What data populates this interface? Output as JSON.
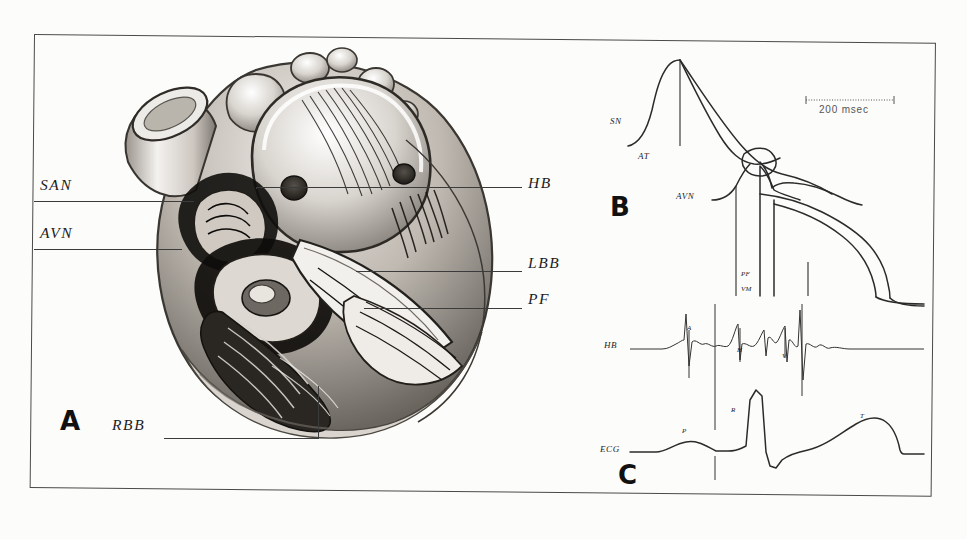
{
  "figure": {
    "caption_absent": true,
    "panels": [
      {
        "id": "A",
        "letter": "A",
        "kind": "anatomical-illustration",
        "subject": "heart cardiac conduction system"
      },
      {
        "id": "B",
        "letter": "B",
        "kind": "action-potential-tracings"
      },
      {
        "id": "C",
        "letter": "C",
        "kind": "electrogram-tracings"
      }
    ]
  },
  "panel_a": {
    "letter": "A",
    "labels_left": [
      {
        "name": "SAN",
        "text": "SAN"
      },
      {
        "name": "AVN",
        "text": "AVN"
      },
      {
        "name": "RBB",
        "text": "RBB"
      }
    ],
    "labels_right": [
      {
        "name": "HB",
        "text": "HB"
      },
      {
        "name": "LBB",
        "text": "LBB"
      },
      {
        "name": "PF",
        "text": "PF"
      }
    ]
  },
  "panel_b": {
    "letter": "B",
    "labels": [
      {
        "name": "SN",
        "text": "SN"
      },
      {
        "name": "AT",
        "text": "AT"
      },
      {
        "name": "AVN",
        "text": "AVN"
      },
      {
        "name": "PF",
        "text": "PF"
      },
      {
        "name": "VM",
        "text": "VM"
      }
    ],
    "scale_bar": {
      "text": "200 msec"
    }
  },
  "panel_c": {
    "letter": "C",
    "traces": [
      {
        "name": "HB",
        "text": "HB",
        "deflections": [
          {
            "name": "A",
            "text": "A"
          },
          {
            "name": "H",
            "text": "H"
          },
          {
            "name": "V",
            "text": "V"
          }
        ]
      },
      {
        "name": "ECG",
        "text": "ECG",
        "waves": [
          {
            "name": "P",
            "text": "P"
          },
          {
            "name": "R",
            "text": "R"
          },
          {
            "name": "T",
            "text": "T"
          }
        ]
      }
    ]
  },
  "margin_bleed": {
    "lines": [
      "",
      "",
      "",
      "",
      "",
      "",
      "",
      ""
    ]
  },
  "colors": {
    "ink": "#2b2b2b",
    "frame": "#4a4a4a",
    "paper": "#fcfcfa",
    "bleed": "#d7d5cf"
  }
}
